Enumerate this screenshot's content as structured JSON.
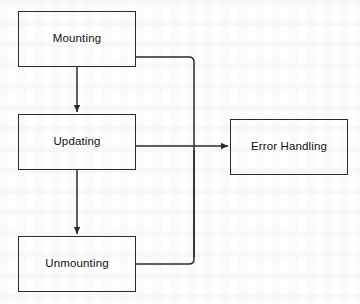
{
  "diagram": {
    "type": "flowchart",
    "background_color": "#fefefe",
    "stroke_color": "#2a2a2a",
    "text_color": "#121212",
    "nodes": [
      {
        "id": "mounting",
        "label": "Mounting",
        "x": 18,
        "y": 11,
        "w": 118,
        "h": 56
      },
      {
        "id": "updating",
        "label": "Updating",
        "x": 18,
        "y": 114,
        "w": 118,
        "h": 56
      },
      {
        "id": "unmounting",
        "label": "Unmounting",
        "x": 18,
        "y": 236,
        "w": 118,
        "h": 56
      },
      {
        "id": "error-handling",
        "label": "Error Handling",
        "x": 230,
        "y": 119,
        "w": 118,
        "h": 56
      }
    ],
    "edges": [
      {
        "id": "mounting-to-updating",
        "from": "mounting",
        "to": "updating",
        "arrowhead": true
      },
      {
        "id": "updating-to-unmounting",
        "from": "updating",
        "to": "unmounting",
        "arrowhead": true
      },
      {
        "id": "updating-to-error-handling",
        "from": "updating",
        "to": "error-handling",
        "arrowhead": true
      },
      {
        "id": "mounting-to-error-bus",
        "from": "mounting",
        "to": "error-handling",
        "arrowhead": false
      },
      {
        "id": "unmounting-to-error-bus",
        "from": "unmounting",
        "to": "error-handling",
        "arrowhead": false
      }
    ]
  }
}
